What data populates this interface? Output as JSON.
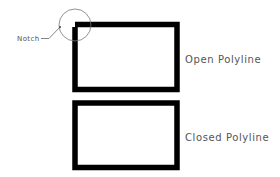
{
  "diagram": {
    "callout": {
      "label": "Notch"
    },
    "shapes": [
      {
        "id": "open",
        "label": "Open Polyline",
        "closed": false
      },
      {
        "id": "closed",
        "label": "Closed Polyline",
        "closed": true
      }
    ],
    "colors": {
      "stroke": "#000000",
      "text": "#555555",
      "callout": "#777777"
    }
  }
}
